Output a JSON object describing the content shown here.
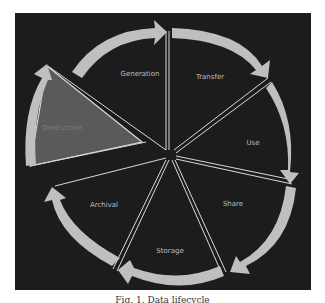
{
  "diagram": {
    "title": "Data lifecycle",
    "colors": {
      "background": "#1c1c1c",
      "arrow": "#bfbfbf",
      "divider": "#d9d9d9",
      "highlight_wedge": "#5a5a5a",
      "label": "#bdbdbd"
    },
    "stages": [
      {
        "label": "Generation"
      },
      {
        "label": "Transfer"
      },
      {
        "label": "Use"
      },
      {
        "label": "Share"
      },
      {
        "label": "Storage"
      },
      {
        "label": "Archival"
      },
      {
        "label": "Destruction",
        "highlighted": true
      }
    ]
  },
  "caption": "Fig. 1. Data lifecycle"
}
